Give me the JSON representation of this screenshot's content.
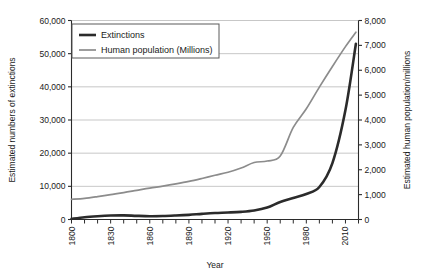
{
  "chart_data": {
    "type": "line",
    "title": "",
    "xlabel": "Year",
    "ylabel": "Estimated numbers of extinctions",
    "y2label": "Estimated human population/millions",
    "xlim": [
      1800,
      2020
    ],
    "ylim": [
      0,
      60000
    ],
    "y2lim": [
      0,
      8000
    ],
    "grid": true,
    "legend_position": "top-left",
    "x_ticks_major": [
      "1800",
      "1830",
      "1860",
      "1890",
      "1920",
      "1950",
      "1980",
      "2010"
    ],
    "x_tick_values_major": [
      1800,
      1830,
      1860,
      1890,
      1920,
      1950,
      1980,
      2010
    ],
    "x_tick_values_minor": [
      1810,
      1820,
      1840,
      1850,
      1870,
      1880,
      1900,
      1910,
      1930,
      1940,
      1960,
      1970,
      1990,
      2000,
      2020
    ],
    "y_ticks": [
      "0",
      "10,000",
      "20,000",
      "30,000",
      "40,000",
      "50,000",
      "60,000"
    ],
    "y_tick_values": [
      0,
      10000,
      20000,
      30000,
      40000,
      50000,
      60000
    ],
    "y2_ticks": [
      "0",
      "1,000",
      "2,000",
      "3,000",
      "4,000",
      "5,000",
      "6,000",
      "7,000",
      "8,000"
    ],
    "y2_tick_values": [
      0,
      1000,
      2000,
      3000,
      4000,
      5000,
      6000,
      7000,
      8000
    ],
    "series": [
      {
        "name": "Extinctions",
        "axis": "left",
        "color": "#2b2b2b",
        "width": 2.6,
        "x": [
          1800,
          1810,
          1820,
          1830,
          1840,
          1850,
          1860,
          1870,
          1880,
          1890,
          1900,
          1910,
          1920,
          1930,
          1940,
          1950,
          1960,
          1970,
          1980,
          1990,
          2000,
          2010,
          2018
        ],
        "values": [
          200,
          700,
          1000,
          1200,
          1250,
          1100,
          1000,
          1050,
          1200,
          1400,
          1700,
          1950,
          2100,
          2300,
          2700,
          3600,
          5300,
          6500,
          7700,
          9800,
          17000,
          33000,
          53000
        ]
      },
      {
        "name": "Human population (Millions)",
        "axis": "right",
        "color": "#8c8c8c",
        "width": 1.7,
        "x": [
          1800,
          1810,
          1820,
          1830,
          1840,
          1850,
          1860,
          1870,
          1880,
          1890,
          1900,
          1910,
          1920,
          1930,
          1940,
          1950,
          1960,
          1970,
          1980,
          1990,
          2000,
          2010,
          2018
        ],
        "values": [
          810,
          850,
          920,
          1000,
          1080,
          1170,
          1260,
          1340,
          1430,
          1530,
          1650,
          1780,
          1900,
          2070,
          2290,
          2350,
          2550,
          3700,
          4450,
          5320,
          6150,
          6950,
          7530
        ]
      }
    ]
  },
  "legend": {
    "items": [
      {
        "label": "Extinctions",
        "color": "#2b2b2b"
      },
      {
        "label": "Human population (Millions)",
        "color": "#8c8c8c"
      }
    ]
  }
}
